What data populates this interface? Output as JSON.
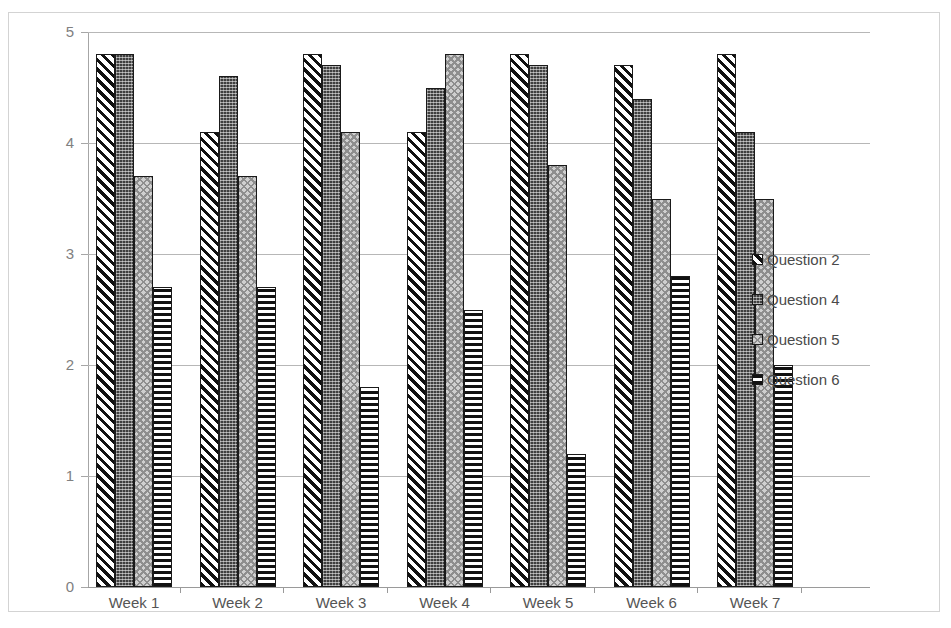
{
  "chart_data": {
    "type": "bar",
    "title": "",
    "subtitle": "",
    "xlabel": "",
    "ylabel": "",
    "grid": true,
    "legend_position": "right",
    "ylim": [
      0,
      5
    ],
    "ytick_labels": [
      "5",
      "4",
      "3",
      "2",
      "1",
      "0"
    ],
    "ytick_values": [
      5,
      4,
      3,
      2,
      1,
      0
    ],
    "categories": [
      "Week 1",
      "Week 2",
      "Week 3",
      "Week 4",
      "Week 5",
      "Week 6",
      "Week 7"
    ],
    "series": [
      {
        "name": "Question 2",
        "pattern": "diagonal-stripes",
        "values": [
          4.8,
          4.1,
          4.8,
          4.1,
          4.8,
          4.7,
          4.8
        ]
      },
      {
        "name": "Question 4",
        "pattern": "dark-grid",
        "values": [
          4.8,
          4.6,
          4.7,
          4.5,
          4.7,
          4.4,
          4.1
        ]
      },
      {
        "name": "Question 5",
        "pattern": "light-checker",
        "values": [
          3.7,
          3.7,
          4.1,
          4.8,
          3.8,
          3.5,
          3.5
        ]
      },
      {
        "name": "Question 6",
        "pattern": "horizontal-stripes",
        "values": [
          2.7,
          2.7,
          1.8,
          2.5,
          1.2,
          2.8,
          2.0
        ]
      }
    ]
  },
  "colors": {
    "gridline": "#b7b7b7",
    "axis": "#9a9a9a",
    "tick_label": "#808080",
    "category_label": "#555555",
    "legend_label": "#4a4a4a",
    "bar_outline": "#1a1a1a",
    "frame": "#d3d3d3",
    "background": "#ffffff"
  },
  "legend": {
    "items": [
      {
        "label": "Question 2",
        "swatch": "diagonal-stripes-swatch"
      },
      {
        "label": "Question 4",
        "swatch": "dark-grid-swatch"
      },
      {
        "label": "Question 5",
        "swatch": "light-checker-swatch"
      },
      {
        "label": "Question 6",
        "swatch": "horizontal-stripes-swatch"
      }
    ]
  }
}
